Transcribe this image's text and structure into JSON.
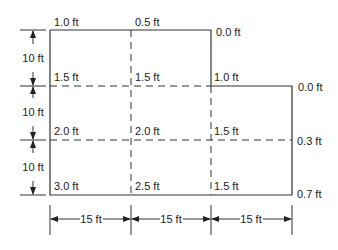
{
  "diagram": {
    "node_labels": {
      "row0": [
        "1.0 ft",
        "0.5 ft",
        "0.0 ft"
      ],
      "row1": [
        "1.5 ft",
        "1.5 ft",
        "1.0 ft",
        "0.0 ft"
      ],
      "row2": [
        "2.0 ft",
        "2.0 ft",
        "1.5 ft",
        "0.3 ft"
      ],
      "row3": [
        "3.0 ft",
        "2.5 ft",
        "1.5 ft",
        "0.7 ft"
      ]
    },
    "vertical_dimensions": [
      "10 ft",
      "10 ft",
      "10 ft"
    ],
    "horizontal_dimensions": [
      "15 ft",
      "15 ft",
      "15 ft"
    ],
    "line_color": "#333333"
  }
}
